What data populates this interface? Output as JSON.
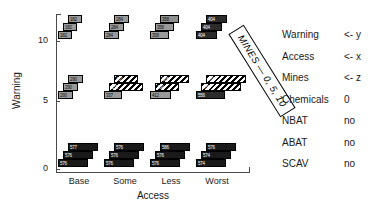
{
  "chart_data": {
    "type": "bar",
    "title": "",
    "subtitle": "",
    "xlabel": "Access",
    "ylabel": "Warning",
    "zlabel": "Mines",
    "grid": false,
    "legend_position": "right",
    "x_categories": [
      "Base",
      "Some",
      "Less",
      "Worst"
    ],
    "y_categories": [
      "0",
      "5",
      "10"
    ],
    "y_ticks": [
      "10",
      "5",
      "0"
    ],
    "z_categories": [
      "0",
      "5",
      "10"
    ],
    "depth_note": "MINES — 0, 5, 10",
    "groups": [
      {
        "warning": "10",
        "access": "Base",
        "row": 0,
        "col": 0,
        "bars": [
          {
            "mines": "10",
            "value": 182,
            "label": "182",
            "shade": "#9a9a9a",
            "hatched": false
          },
          {
            "mines": "5",
            "value": 182,
            "label": "182",
            "shade": "#9a9a9a",
            "hatched": false
          },
          {
            "mines": "0",
            "value": 182,
            "label": "182",
            "shade": "#9a9a9a",
            "hatched": false
          }
        ]
      },
      {
        "warning": "10",
        "access": "Some",
        "row": 0,
        "col": 1,
        "bars": [
          {
            "mines": "10",
            "value": 284,
            "label": "284",
            "shade": "#9a9a9a",
            "hatched": false
          },
          {
            "mines": "5",
            "value": 284,
            "label": "284",
            "shade": "#9a9a9a",
            "hatched": false
          },
          {
            "mines": "0",
            "value": 284,
            "label": "284",
            "shade": "#9a9a9a",
            "hatched": false
          }
        ]
      },
      {
        "warning": "10",
        "access": "Less",
        "row": 0,
        "col": 2,
        "bars": [
          {
            "mines": "10",
            "value": 358,
            "label": "358",
            "shade": "#8f8f8f",
            "hatched": false
          },
          {
            "mines": "5",
            "value": 358,
            "label": "358",
            "shade": "#9a9a9a",
            "hatched": false
          },
          {
            "mines": "0",
            "value": 358,
            "label": "358",
            "shade": "#9a9a9a",
            "hatched": false
          }
        ]
      },
      {
        "warning": "10",
        "access": "Worst",
        "row": 0,
        "col": 3,
        "bars": [
          {
            "mines": "10",
            "value": 404,
            "label": "404",
            "shade": "#2b2b2b",
            "hatched": false
          },
          {
            "mines": "5",
            "value": 404,
            "label": "404",
            "shade": "#2b2b2b",
            "hatched": false
          },
          {
            "mines": "0",
            "value": 404,
            "label": "404",
            "shade": "#2b2b2b",
            "hatched": false
          }
        ]
      },
      {
        "warning": "5",
        "access": "Base",
        "row": 1,
        "col": 0,
        "bars": [
          {
            "mines": "10",
            "value": 290,
            "label": "290",
            "shade": "#9a9a9a",
            "hatched": false
          },
          {
            "mines": "5",
            "value": 290,
            "label": "290",
            "shade": "#9a9a9a",
            "hatched": false
          },
          {
            "mines": "0",
            "value": 290,
            "label": "290",
            "shade": "#9a9a9a",
            "hatched": false
          }
        ]
      },
      {
        "warning": "5",
        "access": "Some",
        "row": 1,
        "col": 1,
        "bars": [
          {
            "mines": "10",
            "value": 461,
            "label": "461",
            "shade": "#3a3a3a",
            "hatched": true
          },
          {
            "mines": "5",
            "value": 653,
            "label": "653",
            "shade": "#3a3a3a",
            "hatched": true
          },
          {
            "mines": "0",
            "value": 337,
            "label": "337",
            "shade": "#9a9a9a",
            "hatched": false
          }
        ]
      },
      {
        "warning": "5",
        "access": "Less",
        "row": 1,
        "col": 2,
        "bars": [
          {
            "mines": "10",
            "value": 565,
            "label": "565",
            "shade": "#3a3a3a",
            "hatched": true
          },
          {
            "mines": "5",
            "value": 464,
            "label": "464",
            "shade": "#3a3a3a",
            "hatched": true
          },
          {
            "mines": "0",
            "value": 412,
            "label": "412",
            "shade": "#9a9a9a",
            "hatched": false
          }
        ]
      },
      {
        "warning": "5",
        "access": "Worst",
        "row": 1,
        "col": 3,
        "bars": [
          {
            "mines": "10",
            "value": 767,
            "label": "767",
            "shade": "#2b2b2b",
            "hatched": true
          },
          {
            "mines": "5",
            "value": 760,
            "label": "760",
            "shade": "#2b2b2b",
            "hatched": true
          },
          {
            "mines": "0",
            "value": 556,
            "label": "556",
            "shade": "#2b2b2b",
            "hatched": false
          }
        ]
      },
      {
        "warning": "0",
        "access": "Base",
        "row": 2,
        "col": 0,
        "bars": [
          {
            "mines": "10",
            "value": 577,
            "label": "577",
            "shade": "#1a1a1a",
            "hatched": false
          },
          {
            "mines": "5",
            "value": 576,
            "label": "576",
            "shade": "#1a1a1a",
            "hatched": false
          },
          {
            "mines": "0",
            "value": 576,
            "label": "576",
            "shade": "#1a1a1a",
            "hatched": false
          }
        ]
      },
      {
        "warning": "0",
        "access": "Some",
        "row": 2,
        "col": 1,
        "bars": [
          {
            "mines": "10",
            "value": 576,
            "label": "576",
            "shade": "#1a1a1a",
            "hatched": false
          },
          {
            "mines": "5",
            "value": 576,
            "label": "576",
            "shade": "#1a1a1a",
            "hatched": false
          },
          {
            "mines": "0",
            "value": 576,
            "label": "576",
            "shade": "#1a1a1a",
            "hatched": false
          }
        ]
      },
      {
        "warning": "0",
        "access": "Less",
        "row": 2,
        "col": 2,
        "bars": [
          {
            "mines": "10",
            "value": 586,
            "label": "586",
            "shade": "#1a1a1a",
            "hatched": false
          },
          {
            "mines": "5",
            "value": 576,
            "label": "576",
            "shade": "#1a1a1a",
            "hatched": false
          },
          {
            "mines": "0",
            "value": 576,
            "label": "576",
            "shade": "#1a1a1a",
            "hatched": false
          }
        ]
      },
      {
        "warning": "0",
        "access": "Worst",
        "row": 2,
        "col": 3,
        "bars": [
          {
            "mines": "10",
            "value": 576,
            "label": "576",
            "shade": "#1a1a1a",
            "hatched": false
          },
          {
            "mines": "5",
            "value": 574,
            "label": "574",
            "shade": "#1a1a1a",
            "hatched": false
          },
          {
            "mines": "0",
            "value": 574,
            "label": "574",
            "shade": "#1a1a1a",
            "hatched": false
          }
        ]
      }
    ]
  },
  "legend": {
    "rows": [
      {
        "key": "Warning",
        "value": "<- y"
      },
      {
        "key": "Access",
        "value": "<- x"
      },
      {
        "key": "Mines",
        "value": "<- z"
      },
      {
        "key": "Chemicals",
        "value": "0"
      },
      {
        "key": "NBAT",
        "value": "no"
      },
      {
        "key": "ABAT",
        "value": "no"
      },
      {
        "key": "SCAV",
        "value": "no"
      }
    ]
  },
  "colors": {
    "axis": "#4a4a4a",
    "text": "#1a1a1a",
    "bar_light": "#9a9a9a",
    "bar_dark": "#2b2b2b",
    "bar_black": "#1a1a1a",
    "background": "#ffffff"
  }
}
